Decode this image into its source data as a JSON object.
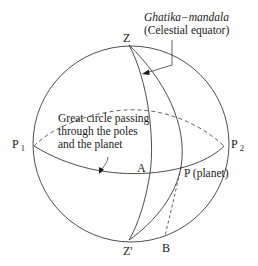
{
  "diagram": {
    "type": "celestial-sphere",
    "labels": {
      "zenith": "Z",
      "nadir": "Z'",
      "pole_1": "P",
      "pole_1_sub": "1",
      "pole_2": "P",
      "pole_2_sub": "2",
      "point_a": "A",
      "planet": "P (planet)",
      "point_b": "B"
    },
    "annotations": {
      "equator_title": "Ghatika−mandala",
      "equator_subtitle": "(Celestial equator)",
      "great_circle_line1": "Great circle passing",
      "great_circle_line2": "through the poles",
      "great_circle_line3": "and the planet"
    },
    "colors": {
      "stroke": "#3a3a3a",
      "text": "#1a1a1a",
      "background": "#ffffff"
    }
  }
}
